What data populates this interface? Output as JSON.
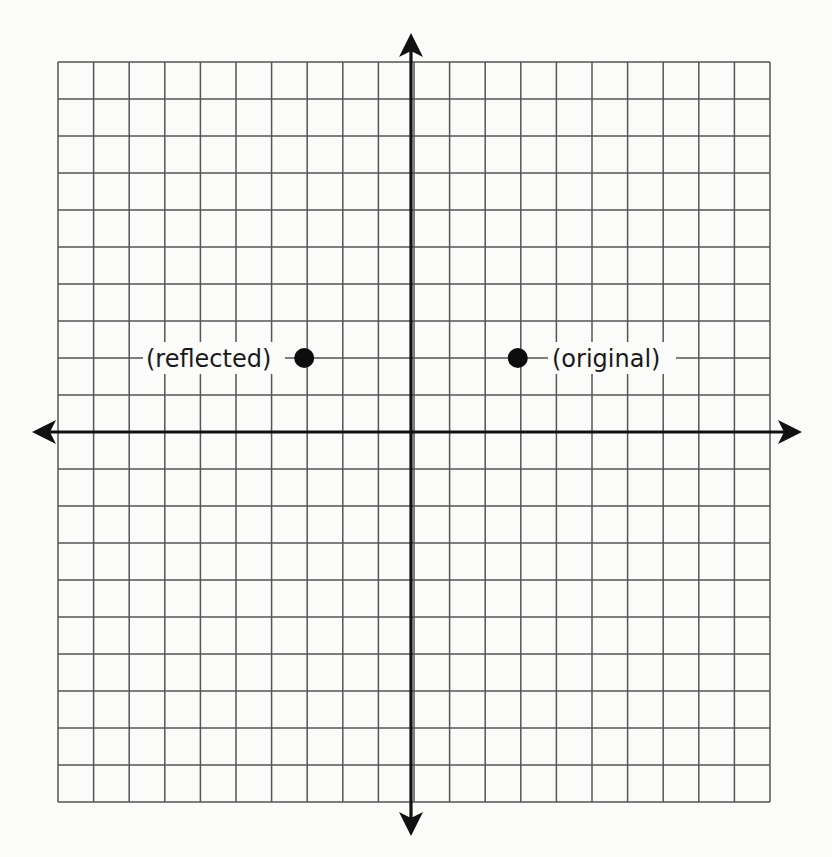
{
  "diagram": {
    "type": "coordinate-plane-reflection",
    "grid": {
      "columns": 20,
      "rows": 20,
      "x_range": [
        -10,
        10
      ],
      "y_range": [
        -10,
        10
      ],
      "line_color": "#555555"
    },
    "axes": {
      "color": "#111111",
      "x_axis_arrows": [
        "left",
        "right"
      ],
      "y_axis_arrows": [
        "up",
        "down"
      ]
    },
    "points": [
      {
        "id": "original",
        "label": "(original)",
        "x": 3,
        "y": 2,
        "label_side": "right"
      },
      {
        "id": "reflected",
        "label": "(reflected)",
        "x": -3,
        "y": 2,
        "label_side": "left"
      }
    ],
    "reflection_axis": "y-axis"
  },
  "chart_data": {
    "type": "scatter",
    "title": "",
    "xlabel": "",
    "ylabel": "",
    "xlim": [
      -10,
      10
    ],
    "ylim": [
      -10,
      10
    ],
    "grid": true,
    "series": [
      {
        "name": "(original)",
        "values": [
          [
            3,
            2
          ]
        ]
      },
      {
        "name": "(reflected)",
        "values": [
          [
            -3,
            2
          ]
        ]
      }
    ]
  }
}
